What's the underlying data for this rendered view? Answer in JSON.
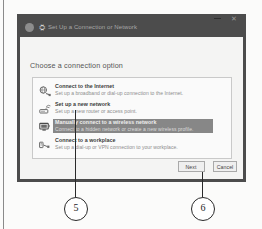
{
  "window": {
    "title": "Set Up a Connection or Network",
    "icons": {
      "back": "back-circle-icon",
      "app": "network-icon",
      "minimize": "minimize-icon",
      "close": "close-icon"
    },
    "close_glyph": "✕",
    "app_glyph": "⛭"
  },
  "body": {
    "heading": "Choose a connection option",
    "options": [
      {
        "icon": "globe-plug-icon",
        "title": "Connect to the Internet",
        "desc": "Set up a broadband or dial-up connection to the Internet.",
        "selected": false
      },
      {
        "icon": "router-icon",
        "title": "Set up a new network",
        "desc": "Set up a new router or access point.",
        "selected": false
      },
      {
        "icon": "wireless-monitor-icon",
        "title": "Manually connect to a wireless network",
        "desc": "Connect to a hidden network or create a new wireless profile.",
        "selected": true
      },
      {
        "icon": "workplace-plug-icon",
        "title": "Connect to a workplace",
        "desc": "Set up a dial-up or VPN connection to your workplace.",
        "selected": false
      }
    ]
  },
  "footer": {
    "next_label": "Next",
    "cancel_label": "Cancel"
  },
  "callouts": [
    {
      "number": "5",
      "target": "manually-connect-to-a-wireless-network-option"
    },
    {
      "number": "6",
      "target": "next-button"
    }
  ],
  "colors": {
    "title_bar": "#4c4c4c",
    "dialog_bg": "#f4f4f3",
    "panel_bg": "#fafafa",
    "selection": "#878787",
    "callout_stroke": "#2a2a2a"
  }
}
